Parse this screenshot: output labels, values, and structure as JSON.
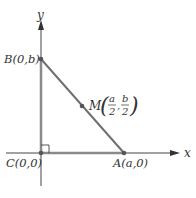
{
  "diagram": {
    "type": "right-triangle-coordinate",
    "axes": {
      "x_label": "x",
      "y_label": "y"
    },
    "points": {
      "B": {
        "label": "B(0,b)"
      },
      "C": {
        "label": "C(0,0)"
      },
      "A": {
        "label": "A(a,0)"
      },
      "M": {
        "name": "M",
        "x_num": "a",
        "x_den": "2",
        "y_num": "b",
        "y_den": "2",
        "separator": ","
      }
    },
    "colors": {
      "axis": "#444444",
      "triangle": "#8a8a8a",
      "hypotenuse": "#6f6f6f",
      "point": "#555555",
      "text": "#333333"
    }
  }
}
